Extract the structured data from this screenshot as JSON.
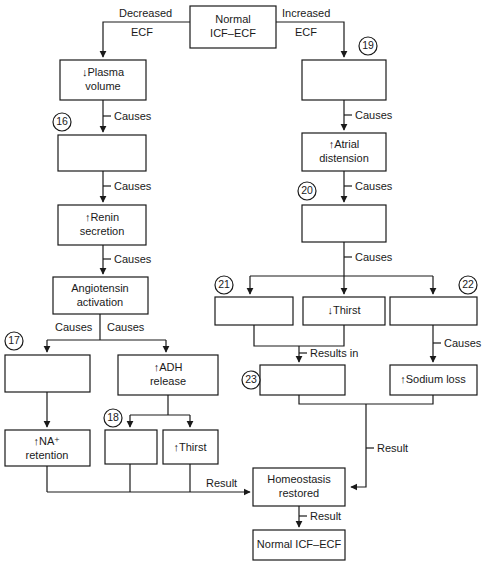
{
  "diagram": {
    "nodes": {
      "normal_icf_ecf_top": "Normal\nICF–ECF",
      "plasma_volume": "↓Plasma\nvolume",
      "box16": "",
      "renin_secretion": "↑Renin\nsecretion",
      "angiotensin_activation": "Angiotensin\nactivation",
      "box17": "",
      "adh_release": "↑ADH\nrelease",
      "na_retention": "↑NA⁺\nretention",
      "box18": "",
      "thirst_left": "↑Thirst",
      "box19": "",
      "atrial_distension": "↑Atrial\ndistension",
      "box20": "",
      "box21": "",
      "thirst_right": "↓Thirst",
      "box22": "",
      "box23": "",
      "sodium_loss": "↑Sodium loss",
      "homeostasis_restored": "Homeostasis\nrestored",
      "normal_icf_ecf_bottom": "Normal ICF–ECF"
    },
    "node_lines": {
      "normal_icf_ecf_top_1": "Normal",
      "normal_icf_ecf_top_2": "ICF–ECF",
      "plasma_volume_1": "↓Plasma",
      "plasma_volume_2": "volume",
      "renin_secretion_1": "↑Renin",
      "renin_secretion_2": "secretion",
      "angiotensin_activation_1": "Angiotensin",
      "angiotensin_activation_2": "activation",
      "adh_release_1": "↑ADH",
      "adh_release_2": "release",
      "na_retention_1": "↑NA⁺",
      "na_retention_2": "retention",
      "thirst_left_1": "↑Thirst",
      "atrial_distension_1": "↑Atrial",
      "atrial_distension_2": "distension",
      "thirst_right_1": "↓Thirst",
      "sodium_loss_1": "↑Sodium loss",
      "homeostasis_restored_1": "Homeostasis",
      "homeostasis_restored_2": "restored",
      "normal_icf_ecf_bottom_1": "Normal ICF–ECF"
    },
    "edge_labels": {
      "decreased": "Decreased",
      "decreased_ecf": "ECF",
      "increased": "Increased",
      "increased_ecf": "ECF",
      "causes_plasma": "Causes",
      "causes_16": "Causes",
      "causes_renin": "Causes",
      "causes_angio": "Causes",
      "causes_left_branch_a": "Causes",
      "causes_left_branch_b": "Causes",
      "causes_19": "Causes",
      "causes_atrial": "Causes",
      "causes_20": "Causes",
      "causes_22": "Causes",
      "results_in_23": "Results in",
      "result_left": "Result",
      "result_right": "Result",
      "result_bottom": "Result"
    },
    "number_markers": {
      "n16": "16",
      "n17": "17",
      "n18": "18",
      "n19": "19",
      "n20": "20",
      "n21": "21",
      "n22": "22",
      "n23": "23"
    },
    "colors": {
      "stroke": "#1a1a1a",
      "fill": "#ffffff",
      "background": "#ffffff"
    }
  }
}
